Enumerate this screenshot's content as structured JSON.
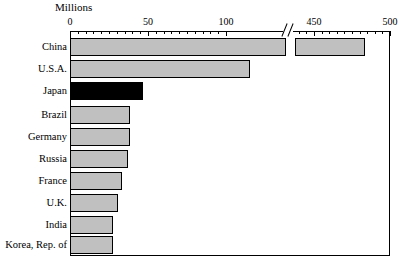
{
  "chart_data": {
    "type": "bar",
    "orientation": "horizontal",
    "title": "",
    "xlabel": "Millions",
    "ylabel": "",
    "axis_unit_label": "Millions",
    "categories": [
      "China",
      "U.S.A.",
      "Japan",
      "Brazil",
      "Germany",
      "Russia",
      "France",
      "U.K.",
      "India",
      "Korea, Rep. of"
    ],
    "values": [
      487,
      120,
      47,
      39,
      39,
      37,
      33,
      30,
      27,
      27
    ],
    "highlighted_category": "Japan",
    "bar_colors": [
      "#c0c0c0",
      "#c0c0c0",
      "#000000",
      "#c0c0c0",
      "#c0c0c0",
      "#c0c0c0",
      "#c0c0c0",
      "#c0c0c0",
      "#c0c0c0",
      "#c0c0c0"
    ],
    "xlim": [
      0,
      500
    ],
    "axis_break": {
      "present": true,
      "from": 130,
      "to": 440
    },
    "xticks": [
      0,
      50,
      100,
      450,
      500
    ],
    "xtick_labels": [
      "0",
      "50",
      "100",
      "450",
      "500"
    ],
    "xminor_tick_step": 5,
    "grid": false,
    "legend": null,
    "axis_position": "top"
  },
  "axis": {
    "title": "Millions",
    "ticks": [
      {
        "label": "0",
        "value": 0,
        "x": 70
      },
      {
        "label": "50",
        "value": 50,
        "x": 148
      },
      {
        "label": "100",
        "value": 100,
        "x": 226
      },
      {
        "label": "450",
        "value": 450,
        "x": 314
      },
      {
        "label": "500",
        "value": 500,
        "x": 390
      }
    ]
  },
  "colors": {
    "bar_fill": "#c0c0c0",
    "bar_highlight": "#000000",
    "outline": "#000000",
    "background": "#ffffff"
  },
  "bars": [
    {
      "label": "China",
      "value": 487,
      "color": "gray",
      "top": 38,
      "height": 18,
      "left": 70,
      "width": 216,
      "segment2_left": 295,
      "segment2_width": 70
    },
    {
      "label": "U.S.A.",
      "value": 120,
      "color": "gray",
      "top": 60,
      "height": 18,
      "left": 70,
      "width": 180,
      "segment2_left": null,
      "segment2_width": 0
    },
    {
      "label": "Japan",
      "value": 47,
      "color": "black",
      "top": 82,
      "height": 18,
      "left": 70,
      "width": 73,
      "segment2_left": null,
      "segment2_width": 0
    },
    {
      "label": "Brazil",
      "value": 39,
      "color": "gray",
      "top": 106,
      "height": 18,
      "left": 70,
      "width": 60,
      "segment2_left": null,
      "segment2_width": 0
    },
    {
      "label": "Germany",
      "value": 39,
      "color": "gray",
      "top": 128,
      "height": 18,
      "left": 70,
      "width": 60,
      "segment2_left": null,
      "segment2_width": 0
    },
    {
      "label": "Russia",
      "value": 37,
      "color": "gray",
      "top": 150,
      "height": 18,
      "left": 70,
      "width": 58,
      "segment2_left": null,
      "segment2_width": 0
    },
    {
      "label": "France",
      "value": 33,
      "color": "gray",
      "top": 172,
      "height": 18,
      "left": 70,
      "width": 52,
      "segment2_left": null,
      "segment2_width": 0
    },
    {
      "label": "U.K.",
      "value": 30,
      "color": "gray",
      "top": 194,
      "height": 18,
      "left": 70,
      "width": 48,
      "segment2_left": null,
      "segment2_width": 0
    },
    {
      "label": "India",
      "value": 27,
      "color": "gray",
      "top": 216,
      "height": 18,
      "left": 70,
      "width": 43,
      "segment2_left": null,
      "segment2_width": 0
    },
    {
      "label": "Korea, Rep. of",
      "value": 27,
      "color": "gray",
      "top": 236,
      "height": 18,
      "left": 70,
      "width": 43,
      "segment2_left": null,
      "segment2_width": 0
    }
  ]
}
